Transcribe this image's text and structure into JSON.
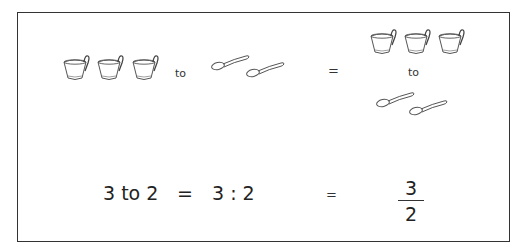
{
  "top_row": {
    "left_cups_count": 3,
    "to_label": "to",
    "left_spoons_count": 2,
    "equals": "=",
    "right_cups_count": 3,
    "right_to_label": "to",
    "right_spoons_count": 2
  },
  "bottom_row": {
    "expr_words": "3 to 2",
    "equals_1": "=",
    "expr_colon": "3 : 2",
    "equals_2": "=",
    "fraction": {
      "numerator": "3",
      "denominator": "2"
    }
  },
  "icons": {
    "cup": "teacup-icon",
    "spoon": "spoon-icon"
  }
}
